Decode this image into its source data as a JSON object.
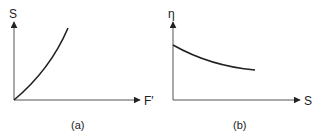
{
  "figure": {
    "panels": [
      {
        "id": "a",
        "caption": "(a)",
        "x_axis_label": "F′",
        "y_axis_label": "S",
        "curve": "increasing, convex (upward-curving) from origin"
      },
      {
        "id": "b",
        "caption": "(b)",
        "x_axis_label": "S",
        "y_axis_label": "η",
        "curve": "decreasing, convex, starting from a positive intercept"
      }
    ],
    "colors": {
      "line": "#222222",
      "axis": "#555555",
      "background": "#ffffff"
    }
  }
}
